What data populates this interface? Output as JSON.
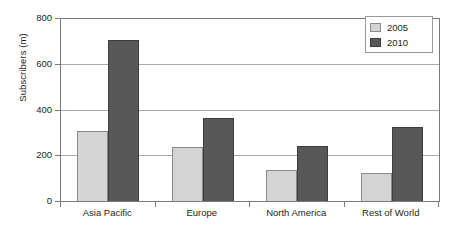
{
  "chart_data": {
    "type": "bar",
    "title": "",
    "subtitle": "",
    "xlabel": "",
    "ylabel": "Subscribers (m)",
    "categories": [
      "Asia Pacific",
      "Europe",
      "North America",
      "Rest of World"
    ],
    "series": [
      {
        "name": "2005",
        "color": "#d4d4d4",
        "values": [
          306,
          236,
          136,
          122
        ]
      },
      {
        "name": "2010",
        "color": "#585858",
        "values": [
          706,
          363,
          240,
          323
        ]
      }
    ],
    "ylim": [
      0,
      800
    ],
    "yticks": [
      0,
      200,
      400,
      600,
      800
    ],
    "ytick_labels": [
      "0",
      "200",
      "400",
      "600",
      "800"
    ],
    "grid": "horizontal",
    "legend_position": "top-right",
    "legend_entries": [
      "2005",
      "2010"
    ],
    "annotations": []
  },
  "axes": {
    "y_title": "Subscribers (m)",
    "tick_color": "#7b7b7b",
    "grid_color": "#a9a9a9"
  },
  "legend": {
    "items": [
      {
        "label": "2005",
        "swatch": "legend-swatch-2005"
      },
      {
        "label": "2010",
        "swatch": "legend-swatch-2010"
      }
    ]
  }
}
